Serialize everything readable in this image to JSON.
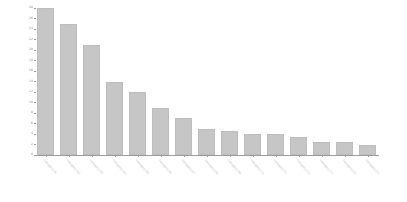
{
  "chart_data": {
    "type": "bar",
    "title": "",
    "subtitle": "",
    "xlabel": "",
    "ylabel": "",
    "ylim": [
      0,
      28
    ],
    "ytick_step": 2,
    "grid": false,
    "legend": null,
    "legend_position": "none",
    "bar_color": "#c6c6c6",
    "bar_edge_color": "#bdbdbd",
    "axis_color": "#9a9a9a",
    "tick_label_color": "#8a8a8a",
    "xlabel_rotation_deg": 49,
    "categories": [
      "category-01",
      "category-02",
      "category-03",
      "category-04",
      "category-05",
      "category-06",
      "category-07",
      "category-08",
      "category-09",
      "category-10",
      "category-11",
      "category-12",
      "category-13",
      "category-14",
      "category-15"
    ],
    "values": [
      28,
      25,
      21,
      14,
      12,
      9,
      7,
      5,
      4.5,
      4,
      4,
      3.5,
      2.5,
      2.5,
      2
    ],
    "yticks": [
      0,
      2,
      4,
      6,
      8,
      10,
      12,
      14,
      16,
      18,
      20,
      22,
      24,
      26,
      28
    ],
    "ytick_labels": [
      "0",
      "2",
      "4",
      "6",
      "8",
      "10",
      "12",
      "14",
      "16",
      "18",
      "20",
      "22",
      "24",
      "26",
      "28"
    ]
  }
}
